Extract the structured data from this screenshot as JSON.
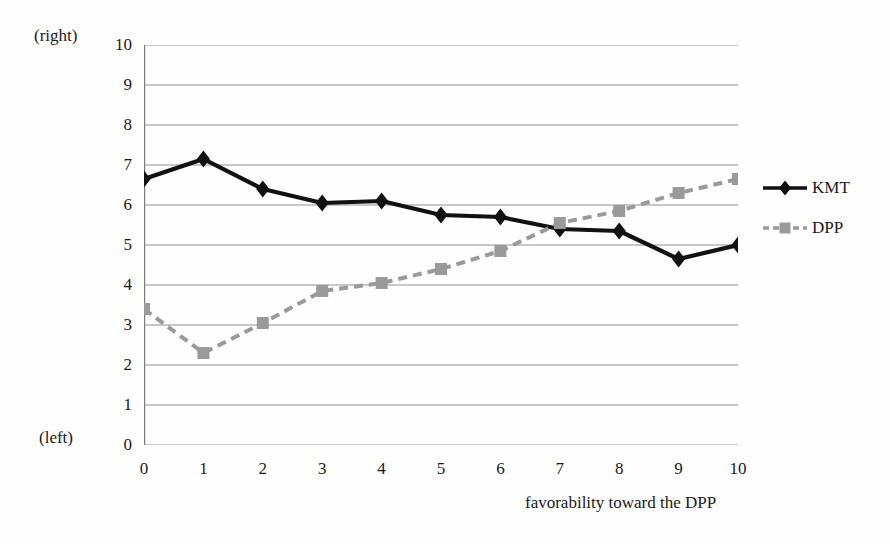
{
  "chart_data": {
    "type": "line",
    "title": "",
    "xlabel": "favorability toward the DPP",
    "ylabel": "",
    "xlim": [
      0,
      10
    ],
    "ylim": [
      0,
      10
    ],
    "grid": true,
    "legend_position": "right",
    "x": [
      0,
      1,
      2,
      3,
      4,
      5,
      6,
      7,
      8,
      9,
      10
    ],
    "xticklabels": [
      "0",
      "1",
      "2",
      "3",
      "4",
      "5",
      "6",
      "7",
      "8",
      "9",
      "10"
    ],
    "yticklabels": [
      "0",
      "1",
      "2",
      "3",
      "4",
      "5",
      "6",
      "7",
      "8",
      "9",
      "10"
    ],
    "y_axis_top_note": "(right)",
    "y_axis_bottom_note": "(left)",
    "series": [
      {
        "name": "KMT",
        "color": "#111111",
        "marker": "diamond",
        "linestyle": "solid",
        "values": [
          6.65,
          7.15,
          6.4,
          6.05,
          6.1,
          5.75,
          5.7,
          5.4,
          5.35,
          4.65,
          5.0
        ]
      },
      {
        "name": "DPP",
        "color": "#9a9a9a",
        "marker": "square",
        "linestyle": "dashed",
        "values": [
          3.4,
          2.3,
          3.05,
          3.85,
          4.05,
          4.4,
          4.85,
          5.55,
          5.85,
          6.3,
          6.65
        ]
      }
    ]
  },
  "legend": {
    "items": [
      {
        "label": "KMT"
      },
      {
        "label": "DPP"
      }
    ]
  },
  "colors": {
    "kmt": "#111111",
    "dpp": "#9a9a9a",
    "grid": "#8d8d8d",
    "axis": "#7a7a7a",
    "background": "#fefefe",
    "text": "#1a1a1a"
  }
}
